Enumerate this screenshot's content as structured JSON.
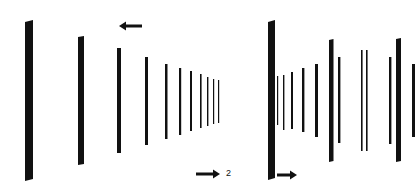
{
  "figure": {
    "panels": [
      {
        "id": "left",
        "description": "Receding row of vertical bars converging toward a vanishing point on the right",
        "bars": [
          {
            "x": 25,
            "w": 8,
            "top": 20,
            "bottom": 181,
            "skew": 2
          },
          {
            "x": 78,
            "w": 6,
            "top": 36,
            "bottom": 165,
            "skew": 1
          },
          {
            "x": 117,
            "w": 4,
            "top": 48,
            "bottom": 153,
            "skew": 0
          },
          {
            "x": 145,
            "w": 3,
            "top": 57,
            "bottom": 145,
            "skew": 0
          },
          {
            "x": 165,
            "w": 2.5,
            "top": 64,
            "bottom": 139,
            "skew": 0
          },
          {
            "x": 179,
            "w": 2.2,
            "top": 68,
            "bottom": 135,
            "skew": 0
          },
          {
            "x": 190,
            "w": 2,
            "top": 71,
            "bottom": 131,
            "skew": 0
          },
          {
            "x": 200,
            "w": 1.6,
            "top": 74,
            "bottom": 128,
            "skew": 0
          },
          {
            "x": 207,
            "w": 1.4,
            "top": 77,
            "bottom": 126,
            "skew": 0
          },
          {
            "x": 213,
            "w": 1.2,
            "top": 79,
            "bottom": 124,
            "skew": 0
          },
          {
            "x": 218,
            "w": 1.2,
            "top": 80,
            "bottom": 123,
            "skew": 0
          }
        ],
        "arrows": [
          {
            "direction": "left",
            "x1": 142,
            "x2": 119,
            "y": 26
          }
        ]
      },
      {
        "id": "right",
        "description": "Bars at varying depths spreading outward, large near bar at left edge",
        "bars": [
          {
            "x": 268,
            "w": 7,
            "top": 20,
            "bottom": 180,
            "skew": 2
          },
          {
            "x": 277,
            "w": 1.2,
            "top": 76,
            "bottom": 125,
            "skew": 0
          },
          {
            "x": 283,
            "w": 1.4,
            "top": 75,
            "bottom": 130,
            "skew": 0
          },
          {
            "x": 291,
            "w": 2,
            "top": 72,
            "bottom": 129,
            "skew": 0
          },
          {
            "x": 302,
            "w": 2.4,
            "top": 68,
            "bottom": 132,
            "skew": 0
          },
          {
            "x": 315,
            "w": 3,
            "top": 64,
            "bottom": 137,
            "skew": 0
          },
          {
            "x": 329,
            "w": 4.5,
            "top": 39,
            "bottom": 162,
            "skew": 1
          },
          {
            "x": 338,
            "w": 2.4,
            "top": 57,
            "bottom": 143,
            "skew": 0
          },
          {
            "x": 361,
            "w": 1.6,
            "top": 50,
            "bottom": 151,
            "skew": 0
          },
          {
            "x": 366,
            "w": 1.6,
            "top": 50,
            "bottom": 151,
            "skew": 0
          },
          {
            "x": 389,
            "w": 2.4,
            "top": 57,
            "bottom": 144,
            "skew": 0
          },
          {
            "x": 396,
            "w": 5,
            "top": 38,
            "bottom": 162,
            "skew": 1
          },
          {
            "x": 412,
            "w": 3,
            "top": 64,
            "bottom": 137,
            "skew": 0
          }
        ],
        "arrows": [
          {
            "direction": "right",
            "x1": 277,
            "x2": 297,
            "y": 175
          }
        ]
      }
    ],
    "shared_arrow": {
      "direction": "right",
      "x1": 196,
      "x2": 220,
      "y": 174
    },
    "labels": [
      {
        "text": "2",
        "x": 226,
        "y": 169
      }
    ],
    "colors": {
      "ink": "#111111",
      "background": "#ffffff"
    }
  }
}
